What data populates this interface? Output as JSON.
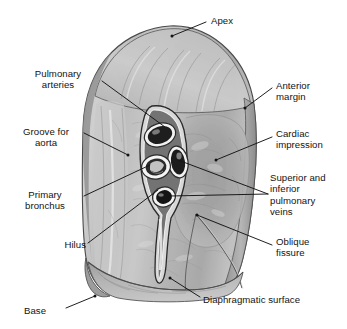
{
  "figure": {
    "ink_color": "#131313",
    "background_color": "#ffffff"
  },
  "labels": {
    "apex": "Apex",
    "pulmonary_arteries": "Pulmonary\narteries",
    "groove_for_aorta": "Groove for\naorta",
    "primary_bronchus": "Primary\nbronchus",
    "hilus": "Hilus",
    "base": "Base",
    "anterior_margin": "Anterior\nmargin",
    "cardiac_impression": "Cardiac\nimpression",
    "pulmonary_veins": "Superior and\ninferior\npulmonary\nveins",
    "oblique_fissure": "Oblique\nfissure",
    "diaphragmatic_surface": "Diaphragmatic surface"
  },
  "structures": {
    "hilum_vessels": [
      "pulmonary-artery-upper",
      "pulmonary-artery-lower",
      "primary-bronchus",
      "superior-pulmonary-vein",
      "inferior-pulmonary-vein"
    ],
    "surfaces": [
      "costal-grooved-surface",
      "cardiac-impression",
      "diaphragmatic-surface"
    ],
    "margins": [
      "apex",
      "anterior-margin",
      "base",
      "oblique-fissure"
    ]
  }
}
